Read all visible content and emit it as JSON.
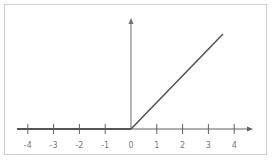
{
  "chart_data": {
    "type": "line",
    "title": "",
    "xlabel": "",
    "ylabel": "",
    "x_ticks": [
      "-4",
      "-3",
      "-2",
      "-1",
      "0",
      "1",
      "2",
      "3",
      "4"
    ],
    "xlim": [
      -4.4,
      4.8
    ],
    "series": [
      {
        "name": "ReLU",
        "x": [
          -4.4,
          0,
          3.6
        ],
        "y": [
          0,
          0,
          3.6
        ],
        "color": "#555555"
      }
    ],
    "grid": false,
    "legend": null,
    "axes": {
      "x_arrow": true,
      "y_arrow": true,
      "y_ticks": false
    }
  },
  "colors": {
    "axis": "#555555",
    "line": "#555555",
    "label": "#7a7a7a",
    "frame": "#cfcfcf"
  }
}
